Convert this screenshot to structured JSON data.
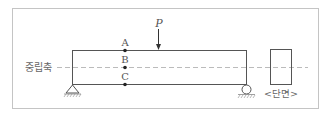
{
  "diagram": {
    "neutral_axis_label": "중립축",
    "section_label": "<단면>",
    "load_label": "P",
    "points": [
      {
        "label": "A",
        "position": "top fiber"
      },
      {
        "label": "B",
        "position": "neutral axis"
      },
      {
        "label": "C",
        "position": "bottom fiber"
      }
    ],
    "supports": {
      "left": "pin",
      "right": "roller"
    }
  },
  "colors": {
    "line": "#555555",
    "dashed_axis": "#aaaaaa",
    "frame": "#bbbbbb"
  }
}
